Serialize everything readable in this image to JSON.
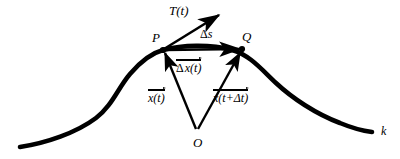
{
  "figure": {
    "background_color": "#ffffff",
    "stroke_color": "#000000",
    "labels": {
      "tangent_vector": "T(t)",
      "arc_length": "s",
      "delta": "Δ",
      "point_p": "P",
      "point_q": "Q",
      "origin": "O",
      "curve_name": "k",
      "displacement_vector": "x(t)",
      "position_vector_t": "x(t)",
      "position_vector_t_dt": "x(t+Δt)",
      "delta_s": "Δs",
      "delta_x_t": "Δ x(t)",
      "x_t_plus_delta_t": "x(t+Δt)"
    },
    "geometry": {
      "point_p": [
        163,
        50
      ],
      "point_q": [
        242,
        49
      ],
      "origin": [
        197,
        131
      ],
      "tangent_tip": [
        220,
        14
      ],
      "curve_start": [
        20,
        147
      ],
      "curve_end": [
        372,
        132
      ]
    }
  }
}
